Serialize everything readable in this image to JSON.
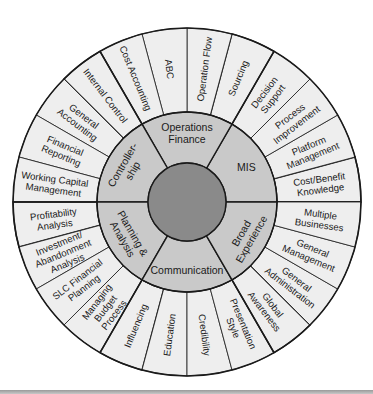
{
  "diagram": {
    "type": "wheel",
    "geometry": {
      "cx": 187,
      "cy": 202,
      "r_outer": 174,
      "r_middle": 90,
      "r_inner": 39
    },
    "colors": {
      "outer_ring": "#eeeeee",
      "middle_ring": "#c9c9c9",
      "inner_circle": "#8a8a8a",
      "stroke": "#1a1a1a",
      "bottom_rule": "#a8a8a8"
    },
    "center": {
      "label": ""
    },
    "sectors": [
      {
        "name": "MIS",
        "lines": [
          "MIS"
        ],
        "start": 0,
        "end": 60,
        "items": [
          {
            "lines": [
              "Cost/Benefit",
              "Knowledge"
            ]
          },
          {
            "lines": [
              "Platform",
              "Management"
            ]
          },
          {
            "lines": [
              "Process",
              "Improvement"
            ]
          },
          {
            "lines": [
              "Decision",
              "Support"
            ]
          }
        ]
      },
      {
        "name": "Operations Finance",
        "lines": [
          "Operations",
          "Finance"
        ],
        "start": 60,
        "end": 120,
        "items": [
          {
            "lines": [
              "Sourcing"
            ]
          },
          {
            "lines": [
              "Operation Flow"
            ]
          },
          {
            "lines": [
              "ABC"
            ]
          },
          {
            "lines": [
              "Cost Accounting"
            ]
          }
        ]
      },
      {
        "name": "Controllership",
        "lines": [
          "Controller-",
          "ship"
        ],
        "start": 120,
        "end": 180,
        "items": [
          {
            "lines": [
              "Internal Control"
            ]
          },
          {
            "lines": [
              "General",
              "Accounting"
            ]
          },
          {
            "lines": [
              "Financial",
              "Reporting"
            ]
          },
          {
            "lines": [
              "Working Capital",
              "Management"
            ]
          }
        ]
      },
      {
        "name": "Planning & Analysis",
        "lines": [
          "Planning &",
          "Analysis"
        ],
        "start": 180,
        "end": 240,
        "items": [
          {
            "lines": [
              "Profitability",
              "Analysis"
            ]
          },
          {
            "lines": [
              "Investment/",
              "Abandonment",
              "Analysis"
            ]
          },
          {
            "lines": [
              "SLC Financial",
              "Planning"
            ]
          },
          {
            "lines": [
              "Managing",
              "Budget",
              "Process"
            ]
          }
        ]
      },
      {
        "name": "Communication",
        "lines": [
          "Communication"
        ],
        "start": 240,
        "end": 300,
        "items": [
          {
            "lines": [
              "Influencing"
            ]
          },
          {
            "lines": [
              "Education"
            ]
          },
          {
            "lines": [
              "Credibility"
            ]
          },
          {
            "lines": [
              "Presentation",
              "Style"
            ]
          }
        ]
      },
      {
        "name": "Broad Experience",
        "lines": [
          "Broad",
          "Experience"
        ],
        "start": 300,
        "end": 360,
        "items": [
          {
            "lines": [
              "Global",
              "Awareness"
            ]
          },
          {
            "lines": [
              "General",
              "Administration"
            ]
          },
          {
            "lines": [
              "General",
              "Management"
            ]
          },
          {
            "lines": [
              "Multiple",
              "Businesses"
            ]
          }
        ]
      }
    ]
  }
}
